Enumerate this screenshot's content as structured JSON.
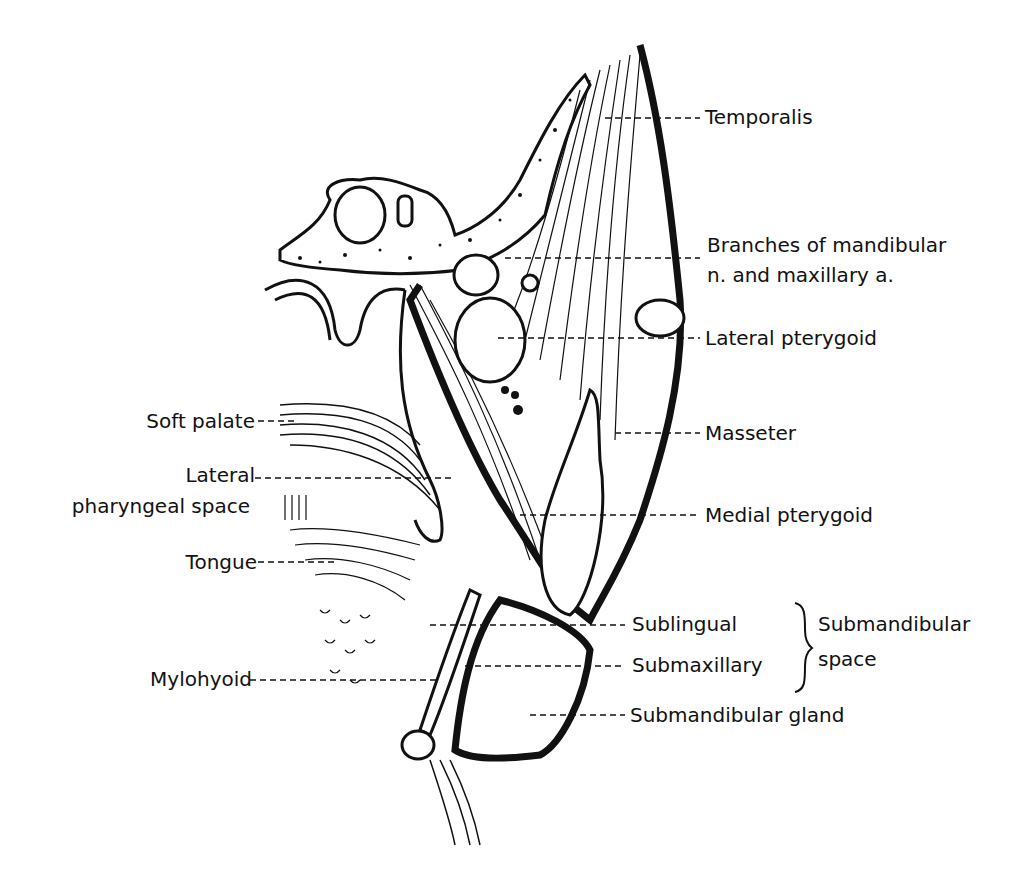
{
  "figure": {
    "labels_right": {
      "temporalis": "Temporalis",
      "branches_line1": "Branches of mandibular",
      "branches_line2": "n. and maxillary a.",
      "lateral_pterygoid": "Lateral pterygoid",
      "masseter": "Masseter",
      "medial_pterygoid": "Medial pterygoid",
      "sublingual": "Sublingual",
      "submaxillary": "Submaxillary",
      "submandibular_space_line1": "Submandibular",
      "submandibular_space_line2": "space",
      "submandibular_gland": "Submandibular gland"
    },
    "labels_left": {
      "soft_palate": "Soft palate",
      "lateral_pharyngeal_line1": "Lateral",
      "lateral_pharyngeal_line2": "pharyngeal space",
      "tongue": "Tongue",
      "mylohyoid": "Mylohyoid"
    },
    "colors": {
      "ink": "#111111",
      "background": "#ffffff"
    }
  }
}
